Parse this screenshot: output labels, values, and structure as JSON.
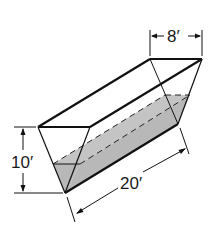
{
  "figure": {
    "type": "trough-triangular-prism",
    "dimensions": {
      "width": "8′",
      "height": "10′",
      "length": "20′"
    },
    "water_fill": true,
    "colors": {
      "line": "#111111",
      "water": "#b8b8b8",
      "background": "#ffffff"
    }
  }
}
